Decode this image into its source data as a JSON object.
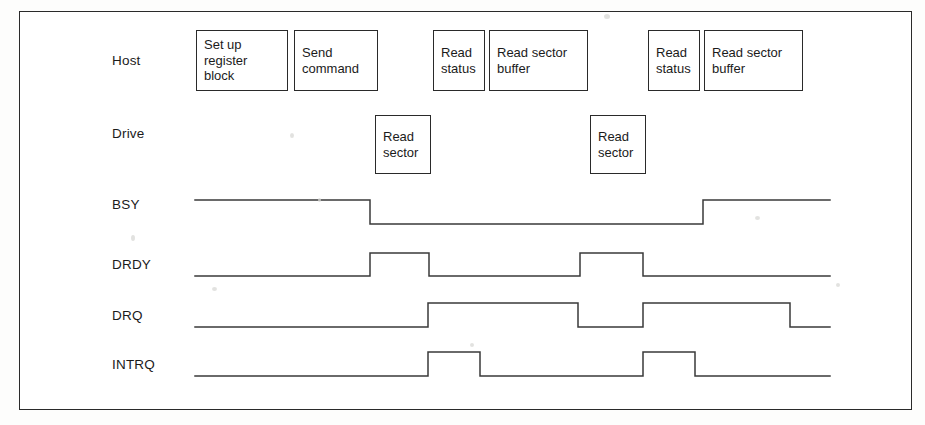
{
  "figure": {
    "border_color": "#2a2a2a",
    "line_color": "#3a3a3a",
    "background": "#ffffff"
  },
  "rows": [
    {
      "id": "host",
      "label": "Host",
      "label_x": 112,
      "label_y": 53
    },
    {
      "id": "drive",
      "label": "Drive",
      "label_x": 112,
      "label_y": 126
    }
  ],
  "signals": [
    {
      "id": "bsy",
      "label": "BSY",
      "label_x": 112,
      "label_y": 197
    },
    {
      "id": "drdy",
      "label": "DRDY",
      "label_x": 112,
      "label_y": 257
    },
    {
      "id": "drq",
      "label": "DRQ",
      "label_x": 112,
      "label_y": 308
    },
    {
      "id": "intrq",
      "label": "INTRQ",
      "label_x": 112,
      "label_y": 357
    }
  ],
  "host_boxes": [
    {
      "id": "set-up-register-block",
      "text": "Set  up\nregister\nblock",
      "x": 196,
      "y": 30,
      "w": 92,
      "h": 61
    },
    {
      "id": "send-command",
      "text": "Send\ncommand",
      "x": 294,
      "y": 30,
      "w": 84,
      "h": 61
    },
    {
      "id": "read-status-1",
      "text": "Read\nstatus",
      "x": 433,
      "y": 30,
      "w": 52,
      "h": 61
    },
    {
      "id": "read-sector-buffer-1",
      "text": "Read  sector\nbuffer",
      "x": 489,
      "y": 30,
      "w": 99,
      "h": 61
    },
    {
      "id": "read-status-2",
      "text": "Read\nstatus",
      "x": 648,
      "y": 30,
      "w": 52,
      "h": 61
    },
    {
      "id": "read-sector-buffer-2",
      "text": "Read  sector\nbuffer",
      "x": 704,
      "y": 30,
      "w": 99,
      "h": 61
    }
  ],
  "drive_boxes": [
    {
      "id": "read-sector-1",
      "text": "Read\nsector",
      "x": 375,
      "y": 115,
      "w": 56,
      "h": 59
    },
    {
      "id": "read-sector-2",
      "text": "Read\nsector",
      "x": 590,
      "y": 115,
      "w": 56,
      "h": 59
    }
  ],
  "chart_data": {
    "type": "line",
    "xlabel": "",
    "ylabel": "",
    "grid": false,
    "legend": "none",
    "x_start": 195,
    "x_end": 830,
    "series": [
      {
        "name": "BSY",
        "low_y": 224,
        "high_y": 200,
        "initial_level": 1,
        "transitions": [
          {
            "x": 370,
            "to": 0
          },
          {
            "x": 703,
            "to": 1
          }
        ],
        "final_level": 1
      },
      {
        "name": "DRDY",
        "low_y": 276,
        "high_y": 253,
        "initial_level": 0,
        "transitions": [
          {
            "x": 370,
            "to": 1
          },
          {
            "x": 429,
            "to": 0
          },
          {
            "x": 580,
            "to": 1
          },
          {
            "x": 643,
            "to": 0
          }
        ],
        "final_level": 0
      },
      {
        "name": "DRQ",
        "low_y": 327,
        "high_y": 303,
        "initial_level": 0,
        "transitions": [
          {
            "x": 428,
            "to": 1
          },
          {
            "x": 578,
            "to": 0
          },
          {
            "x": 643,
            "to": 1
          },
          {
            "x": 790,
            "to": 0
          }
        ],
        "final_level": 0
      },
      {
        "name": "INTRQ",
        "low_y": 376,
        "high_y": 352,
        "initial_level": 0,
        "transitions": [
          {
            "x": 428,
            "to": 1
          },
          {
            "x": 480,
            "to": 0
          },
          {
            "x": 643,
            "to": 1
          },
          {
            "x": 695,
            "to": 0
          }
        ],
        "final_level": 0
      }
    ]
  },
  "specks": [
    {
      "x": 131,
      "y": 235,
      "w": 4,
      "h": 6
    },
    {
      "x": 212,
      "y": 287,
      "w": 5,
      "h": 4
    },
    {
      "x": 290,
      "y": 133,
      "w": 4,
      "h": 5
    },
    {
      "x": 318,
      "y": 198,
      "w": 3,
      "h": 4
    },
    {
      "x": 604,
      "y": 14,
      "w": 6,
      "h": 5
    },
    {
      "x": 755,
      "y": 216,
      "w": 5,
      "h": 4
    },
    {
      "x": 836,
      "y": 283,
      "w": 4,
      "h": 4
    },
    {
      "x": 470,
      "y": 343,
      "w": 4,
      "h": 4
    }
  ]
}
